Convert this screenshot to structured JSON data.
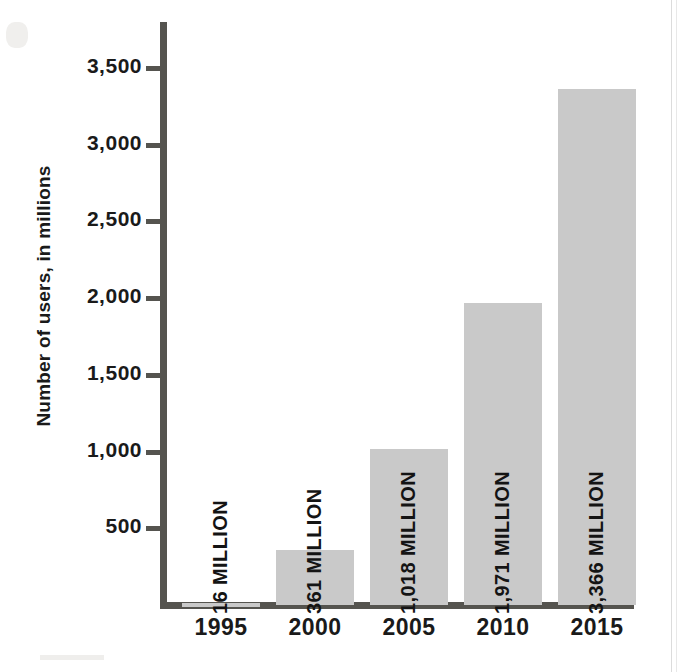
{
  "chart_data": {
    "type": "bar",
    "title": "",
    "subtitle": "",
    "xlabel": "",
    "ylabel": "Number of users, in millions",
    "categories": [
      "1995",
      "2000",
      "2005",
      "2010",
      "2015"
    ],
    "values": [
      16,
      361,
      1018,
      1971,
      3366
    ],
    "value_labels": [
      "16 MILLION",
      "361 MILLION",
      "1,018 MILLION",
      "1,971 MILLION",
      "3,366 MILLION"
    ],
    "ylim": [
      0,
      3800
    ],
    "yticks": [
      500,
      1000,
      1500,
      2000,
      2500,
      3000,
      3500
    ],
    "ytick_labels": [
      "500",
      "1,000",
      "1,500",
      "2,000",
      "2,500",
      "3,000",
      "3,500"
    ],
    "grid": false,
    "legend": null,
    "bar_color": "#c9c9c9",
    "axis_color": "#55544f",
    "text_color": "#1a1a1a",
    "background": "#ffffff",
    "series": [
      {
        "name": "Number of users, in millions",
        "values": [
          16,
          361,
          1018,
          1971,
          3366
        ]
      }
    ]
  }
}
